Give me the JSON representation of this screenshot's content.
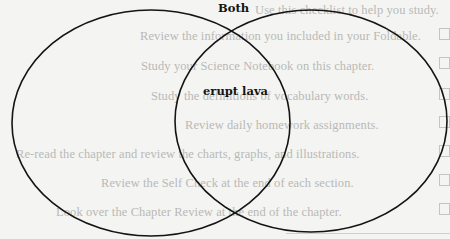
{
  "diagram": {
    "type": "venn",
    "labels": {
      "both": "Both",
      "overlap_text": "erupt lava"
    },
    "circles": [
      {
        "id": "left",
        "cx": 151,
        "cy": 123,
        "rx": 139,
        "ry": 113,
        "stroke": "#141414"
      },
      {
        "id": "right",
        "cx": 311,
        "cy": 121,
        "rx": 136,
        "ry": 111,
        "stroke": "#141414"
      }
    ],
    "regions": {
      "left_only": "",
      "overlap": "erupt lava",
      "right_only": ""
    }
  },
  "bleed_through": {
    "intro": "Use this checklist to help you study.",
    "items": [
      "Review the information you included in your Foldable.",
      "Study your Science Notebook on this chapter.",
      "Study the definitions of vocabulary words.",
      "Review daily homework assignments.",
      "Re-read the chapter and review the charts, graphs, and illustrations.",
      "Review the Self Check at the end of each section.",
      "Look over the Chapter Review at the end of the chapter."
    ],
    "color": "#b9b9b6"
  },
  "colors": {
    "paper": "#f4f4f2",
    "ink": "#141414"
  }
}
